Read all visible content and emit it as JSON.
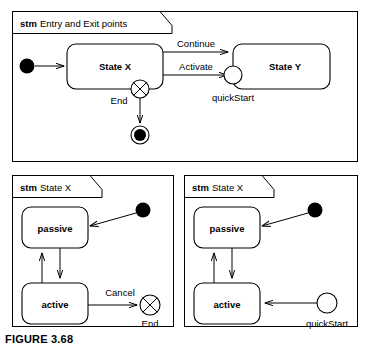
{
  "figure": {
    "caption": "FIGURE 3.68"
  },
  "panels": [
    {
      "id": "entry-exit-points",
      "frame_keyword": "stm",
      "frame_name": "Entry and Exit points",
      "states": [
        {
          "name": "State X"
        },
        {
          "name": "State Y"
        }
      ],
      "transitions": [
        {
          "label": "Continue",
          "from": "State X",
          "to": "State Y"
        },
        {
          "label": "Activate",
          "from": "State X",
          "to": "quickStart"
        }
      ],
      "pseudostates": [
        {
          "kind": "initial",
          "label": ""
        },
        {
          "kind": "exit-point",
          "label": "End"
        },
        {
          "kind": "entry-point",
          "label": "quickStart"
        },
        {
          "kind": "final",
          "label": ""
        }
      ]
    },
    {
      "id": "state-x-exit",
      "frame_keyword": "stm",
      "frame_name": "State X",
      "states": [
        {
          "name": "passive"
        },
        {
          "name": "active"
        }
      ],
      "transitions": [
        {
          "label": "Cancel",
          "from": "active",
          "to": "End"
        }
      ],
      "pseudostates": [
        {
          "kind": "initial",
          "label": ""
        },
        {
          "kind": "exit-point",
          "label": "End"
        }
      ]
    },
    {
      "id": "state-x-entry",
      "frame_keyword": "stm",
      "frame_name": "State X",
      "states": [
        {
          "name": "passive"
        },
        {
          "name": "active"
        }
      ],
      "transitions": [],
      "pseudostates": [
        {
          "kind": "initial",
          "label": ""
        },
        {
          "kind": "entry-point",
          "label": "quickStart"
        }
      ]
    }
  ],
  "colors": {
    "stroke": "#000000",
    "fill": "#ffffff",
    "background": "#ffffff"
  }
}
